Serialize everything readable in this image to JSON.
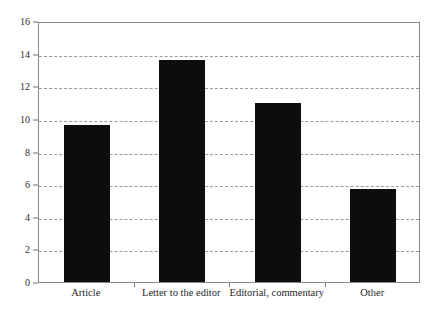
{
  "chart_data": {
    "type": "bar",
    "title": "",
    "subtitle": "",
    "xlabel": "",
    "ylabel": "",
    "categories": [
      "Article",
      "Letter to the editor",
      "Editorial, commentary",
      "Other"
    ],
    "values": [
      9.6,
      13.6,
      10.95,
      5.7
    ],
    "ylim": [
      0,
      16
    ],
    "y_ticks": [
      0,
      2,
      4,
      6,
      8,
      10,
      12,
      14,
      16
    ],
    "y_tick_labels": [
      "0",
      "2",
      "4",
      "6",
      "8",
      "10",
      "12",
      "14",
      "16"
    ],
    "grid": true,
    "grid_axis": "y",
    "grid_style": "dashed",
    "legend": "none",
    "bar_color": "#0d0d0d",
    "grid_color": "#9a9a9a",
    "frame_color": "#8a8a8a",
    "background_color": "#ffffff"
  }
}
